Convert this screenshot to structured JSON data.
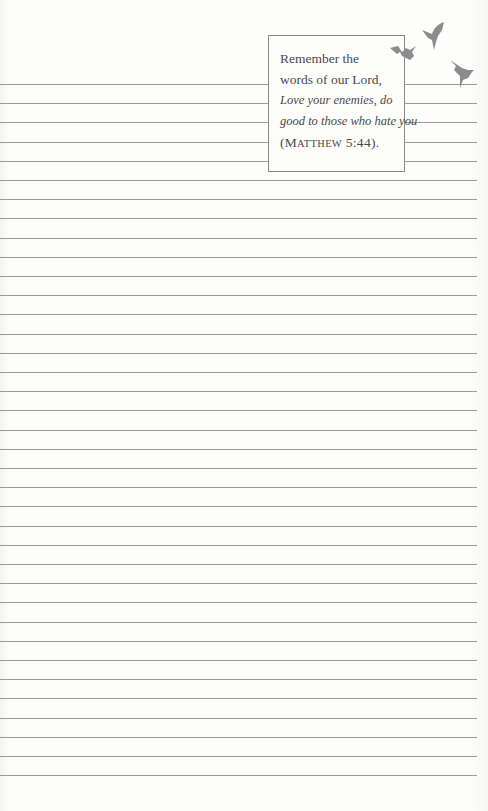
{
  "page": {
    "type": "lined journal page",
    "line_count": 37,
    "first_line_y": 84,
    "line_spacing": 19.2,
    "line_color": "#9a9a9a"
  },
  "quote": {
    "line1": "Remember the",
    "line2": "words of our Lord,",
    "line3": "Love your enemies, do",
    "line4": "good to those who hate you",
    "ref_open": "(M",
    "ref_small": "ATTHEW",
    "ref_close": " 5:44)."
  },
  "decoration": {
    "icon": "birds-icon",
    "bird_count": 3,
    "color": "#8c8c8c"
  }
}
